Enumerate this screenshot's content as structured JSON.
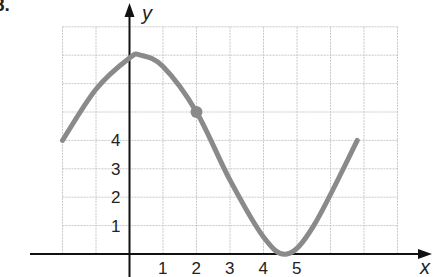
{
  "problem_number": "8.",
  "chart_data": {
    "type": "line",
    "title": "",
    "xlabel": "x",
    "ylabel": "y",
    "x_tick_labels": [
      "1",
      "2",
      "3",
      "4",
      "5"
    ],
    "y_tick_labels": [
      "1",
      "2",
      "3",
      "4"
    ],
    "xlim": [
      -2,
      8
    ],
    "ylim": [
      0,
      8
    ],
    "grid": true,
    "series": [
      {
        "name": "curve",
        "color": "#8a8a8a",
        "x": [
          -2,
          -1,
          0,
          0.33,
          1,
          2,
          3,
          4,
          4.7,
          5.5,
          6.8
        ],
        "y": [
          4,
          5.8,
          6.9,
          7.0,
          6.6,
          5.0,
          2.6,
          0.6,
          0,
          1.0,
          4.0
        ]
      }
    ],
    "marked_point": {
      "x": 2,
      "y": 5
    }
  }
}
